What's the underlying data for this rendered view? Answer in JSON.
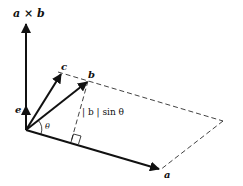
{
  "figure": {
    "type": "vector cross product diagram",
    "labels": {
      "cross_product": "a × b",
      "vector_c": "c",
      "vector_b": "b",
      "vector_a": "a",
      "unit_e": "e",
      "angle": "θ",
      "height": "| b | sin θ"
    },
    "colors": {
      "line": "#111111",
      "background": "#ffffff"
    }
  }
}
